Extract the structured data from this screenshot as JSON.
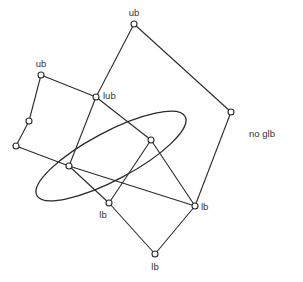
{
  "diagram": {
    "title": "",
    "nodes": [
      {
        "id": "ub_top",
        "x": 134,
        "y": 24
      },
      {
        "id": "ub_left",
        "x": 41,
        "y": 75
      },
      {
        "id": "lub",
        "x": 96,
        "y": 97
      },
      {
        "id": "right",
        "x": 231,
        "y": 112
      },
      {
        "id": "left_mid",
        "x": 29,
        "y": 121
      },
      {
        "id": "inner",
        "x": 151,
        "y": 140
      },
      {
        "id": "left_low",
        "x": 16,
        "y": 146
      },
      {
        "id": "center",
        "x": 69,
        "y": 166
      },
      {
        "id": "lb_left",
        "x": 109,
        "y": 203
      },
      {
        "id": "lb_right",
        "x": 195,
        "y": 206
      },
      {
        "id": "lb_bottom",
        "x": 155,
        "y": 254
      }
    ],
    "edges": [
      [
        "ub_top",
        "right"
      ],
      [
        "ub_top",
        "lub"
      ],
      [
        "ub_left",
        "lub"
      ],
      [
        "ub_left",
        "left_mid"
      ],
      [
        "left_mid",
        "left_low"
      ],
      [
        "left_low",
        "center"
      ],
      [
        "lub",
        "center"
      ],
      [
        "lub",
        "inner"
      ],
      [
        "right",
        "lb_right"
      ],
      [
        "center",
        "lb_right"
      ],
      [
        "center",
        "lb_left"
      ],
      [
        "inner",
        "lb_left"
      ],
      [
        "inner",
        "lb_right"
      ],
      [
        "lb_left",
        "lb_bottom"
      ],
      [
        "lb_right",
        "lb_bottom"
      ]
    ],
    "labels": {
      "ub_top": "ub",
      "ub_left": "ub",
      "lub": "lub",
      "lb_left": "lb",
      "lb_right": "lb",
      "lb_bottom": "lb",
      "no_glb": "no glb"
    },
    "enclosure": {
      "cx": 111,
      "cy": 156,
      "rx": 84,
      "ry": 24,
      "rotate": -28
    }
  }
}
